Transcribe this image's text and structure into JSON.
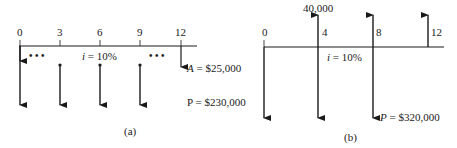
{
  "diagram_a": {
    "caption": "(a)",
    "periods": [
      "0",
      "3",
      "6",
      "9",
      "12"
    ],
    "interest_var": "i",
    "interest_rate": "= 10%",
    "dots_left": "• • •",
    "dots_right": "• • •",
    "annuity_var": "A",
    "annuity_value": "= $25,000",
    "present_value": "P = $230,000"
  },
  "diagram_b": {
    "caption": "(b)",
    "periods": [
      "0",
      "4",
      "8",
      "12"
    ],
    "receipt_value": "40,000",
    "interest_var": "i",
    "interest_rate": "= 10%",
    "present_var": "P",
    "present_value": "= $320,000"
  },
  "colors": {
    "ink": "#1a1a1a",
    "background": "#ffffff"
  }
}
